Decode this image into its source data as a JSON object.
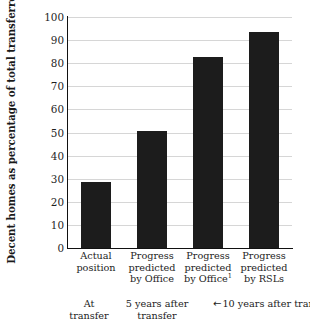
{
  "chart_data": {
    "type": "bar",
    "title": "",
    "xlabel": "",
    "ylabel": "Decent homes as percentage of total transferred",
    "ylim": [
      0,
      100
    ],
    "yticks": [
      100,
      90,
      80,
      70,
      60,
      50,
      40,
      30,
      20,
      10,
      0
    ],
    "grid": true,
    "legend": "none",
    "bar_color": "#1c1c1c",
    "gridline_color": "#d6d6d6",
    "axis_color": "#111111",
    "categories": [
      "Actual position",
      "Progress predicted by Office",
      "Progress predicted by Office",
      "Progress predicted by RSLs"
    ],
    "category_lines": [
      [
        "Actual",
        "position"
      ],
      [
        "Progress",
        "predicted",
        "by Office"
      ],
      [
        "Progress",
        "predicted",
        "by Office"
      ],
      [
        "Progress",
        "predicted",
        "by RSLs"
      ]
    ],
    "category_footnotes": [
      "",
      "",
      "1",
      ""
    ],
    "values": [
      28.5,
      50.5,
      82.5,
      93.5
    ],
    "annotations": {
      "periods": [
        {
          "line1": "At",
          "line2": "transfer",
          "arrows": false
        },
        {
          "line1": "5 years after",
          "line2": "transfer",
          "arrows": false
        },
        {
          "line1": "10 years after transfer",
          "line2": "",
          "arrows": true,
          "left_arrow": "←",
          "right_arrow": "→"
        }
      ]
    }
  }
}
